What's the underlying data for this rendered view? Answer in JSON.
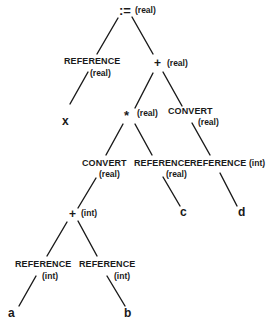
{
  "diagram": {
    "kind": "abstract syntax tree with type annotations",
    "nodes": {
      "assign": {
        "label": ":=",
        "type": "(real)"
      },
      "ref_x": {
        "label": "REFERENCE",
        "type": "(real)"
      },
      "leaf_x": {
        "label": "x"
      },
      "plus_real": {
        "label": "+",
        "type": "(real)"
      },
      "mul": {
        "label": "*",
        "type": "(real)"
      },
      "convert_right": {
        "label": "CONVERT",
        "type": "(real)"
      },
      "convert_left": {
        "label": "CONVERT",
        "type": "(real)"
      },
      "ref_c": {
        "label": "REFERENCE",
        "type": "(real)"
      },
      "leaf_c": {
        "label": "c"
      },
      "ref_d": {
        "label": "REFERENCE",
        "type": "(int)"
      },
      "leaf_d": {
        "label": "d"
      },
      "plus_int": {
        "label": "+",
        "type": "(int)"
      },
      "ref_a": {
        "label": "REFERENCE",
        "type": "(int)"
      },
      "leaf_a": {
        "label": "a"
      },
      "ref_b": {
        "label": "REFERENCE",
        "type": "(int)"
      },
      "leaf_b": {
        "label": "b"
      }
    },
    "edges": [
      [
        "assign",
        "ref_x"
      ],
      [
        "assign",
        "plus_real"
      ],
      [
        "ref_x",
        "leaf_x"
      ],
      [
        "plus_real",
        "mul"
      ],
      [
        "plus_real",
        "convert_right"
      ],
      [
        "mul",
        "convert_left"
      ],
      [
        "mul",
        "ref_c"
      ],
      [
        "convert_right",
        "ref_d"
      ],
      [
        "ref_c",
        "leaf_c"
      ],
      [
        "ref_d",
        "leaf_d"
      ],
      [
        "convert_left",
        "plus_int"
      ],
      [
        "plus_int",
        "ref_a"
      ],
      [
        "plus_int",
        "ref_b"
      ],
      [
        "ref_a",
        "leaf_a"
      ],
      [
        "ref_b",
        "leaf_b"
      ]
    ]
  }
}
